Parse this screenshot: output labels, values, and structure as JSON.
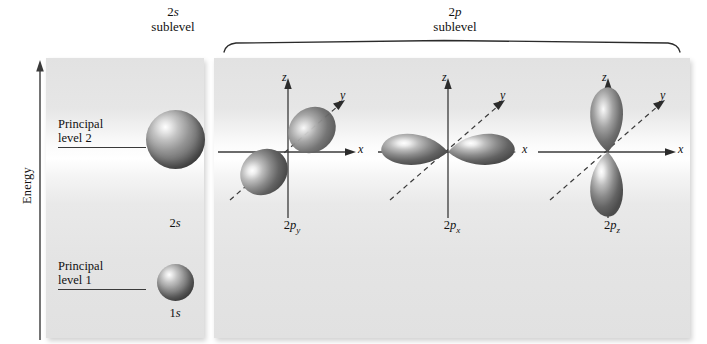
{
  "figure": {
    "axis": {
      "energy_label": "Energy",
      "direction": "upward",
      "arrow_icon": "up-arrow-icon"
    },
    "sublevels": [
      {
        "id": "2s",
        "prefix": "2",
        "symbol": "s",
        "word": "sublevel"
      },
      {
        "id": "2p",
        "prefix": "2",
        "symbol": "p",
        "word": "sublevel"
      }
    ],
    "principal_levels": [
      {
        "id": "level2",
        "line1": "Principal",
        "line2": "level 2"
      },
      {
        "id": "level1",
        "line1": "Principal",
        "line2": "level 1"
      }
    ],
    "s_orbitals": [
      {
        "id": "2s",
        "prefix": "2",
        "symbol": "s",
        "shape": "sphere",
        "level": 2
      },
      {
        "id": "1s",
        "prefix": "1",
        "symbol": "s",
        "shape": "sphere",
        "level": 1
      }
    ],
    "p_orbitals": [
      {
        "id": "2py",
        "prefix": "2",
        "symbol": "p",
        "subscript": "y",
        "shape": "dumbbell",
        "orientation": "along-y-axis",
        "axes": [
          "z",
          "y",
          "x"
        ]
      },
      {
        "id": "2px",
        "prefix": "2",
        "symbol": "p",
        "subscript": "x",
        "shape": "dumbbell",
        "orientation": "along-x-axis",
        "axes": [
          "z",
          "y",
          "x"
        ]
      },
      {
        "id": "2pz",
        "prefix": "2",
        "symbol": "p",
        "subscript": "z",
        "shape": "dumbbell",
        "orientation": "along-z-axis",
        "axes": [
          "z",
          "y",
          "x"
        ]
      }
    ],
    "axis_labels": {
      "x": "x",
      "y": "y",
      "z": "z"
    },
    "colors": {
      "panel_background": "#e6e6e6",
      "orbital_dark": "#4a4a4a",
      "orbital_light": "#ffffff",
      "axis_line": "#3a3a3a",
      "text": "#111111"
    }
  }
}
